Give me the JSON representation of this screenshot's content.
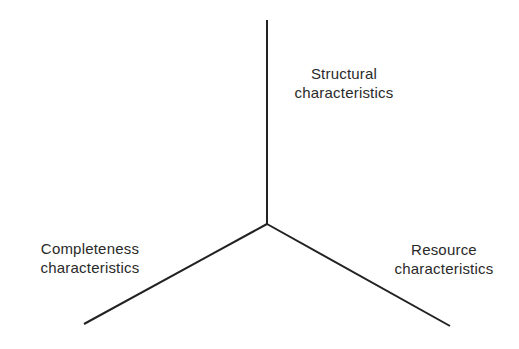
{
  "diagram": {
    "type": "three-axis",
    "line_color": "#222222",
    "origin": {
      "x": 267,
      "y": 224
    },
    "axes": [
      {
        "name": "structural",
        "end": {
          "x": 267,
          "y": 20
        },
        "label_lines": [
          "Structural",
          "characteristics"
        ]
      },
      {
        "name": "completeness",
        "end": {
          "x": 84,
          "y": 324
        },
        "label_lines": [
          "Completeness",
          "characteristics"
        ]
      },
      {
        "name": "resource",
        "end": {
          "x": 450,
          "y": 326
        },
        "label_lines": [
          "Resource",
          "characteristics"
        ]
      }
    ]
  }
}
